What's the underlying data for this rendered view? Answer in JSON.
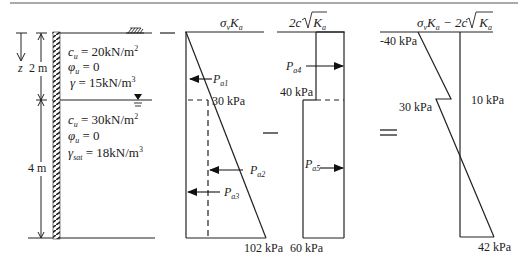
{
  "figure": {
    "soil_profile": {
      "layer1": {
        "cu": "c_u = 20kN/m²",
        "cu_sym": "c",
        "cu_sub": "u",
        "cu_val": " = 20kN/m",
        "cu_sup": "2",
        "phi_sym": "φ",
        "phi_sub": "u",
        "phi_val": " = 0",
        "gamma_sym": "γ",
        "gamma_val": " = 15kN/m",
        "gamma_sup": "3"
      },
      "layer2": {
        "cu_sym": "c",
        "cu_sub": "u",
        "cu_val": " = 30kN/m",
        "cu_sup": "2",
        "phi_sym": "φ",
        "phi_sub": "u",
        "phi_val": " = 0",
        "gamma_sym": "γ",
        "gamma_sub": "sat",
        "gamma_val": " = 18kN/m",
        "gamma_sup": "3"
      },
      "dim_z": "z",
      "dim_top": "2 m",
      "dim_bottom": "4 m"
    },
    "diagram1": {
      "header": "σvKa",
      "h_sigma": "σ",
      "h_v": "v",
      "h_K": "K",
      "h_a": "a",
      "label_30": "30 kPa",
      "label_102": "102 kPa",
      "forces": [
        {
          "sym": "P",
          "sub": "a1"
        },
        {
          "sym": "P",
          "sub": "a2"
        },
        {
          "sym": "P",
          "sub": "a3"
        }
      ]
    },
    "operator_minus": "—",
    "diagram2": {
      "header_pre": "2c",
      "header_K": "K",
      "header_a": "a",
      "label_40": "40 kPa",
      "label_60": "60 kPa",
      "forces": [
        {
          "sym": "P",
          "sub": "a4"
        },
        {
          "sym": "P",
          "sub": "a5"
        }
      ]
    },
    "operator_equals": "=",
    "diagram3": {
      "h_sigma": "σ",
      "h_v": "v",
      "h_K": "K",
      "h_a": "a",
      "h_minus": " − 2c",
      "h_K2": "K",
      "h_a2": "a",
      "label_top": "-40 kPa",
      "label_30": "30 kPa",
      "label_10": "10 kPa",
      "label_42": "42 kPa"
    }
  }
}
